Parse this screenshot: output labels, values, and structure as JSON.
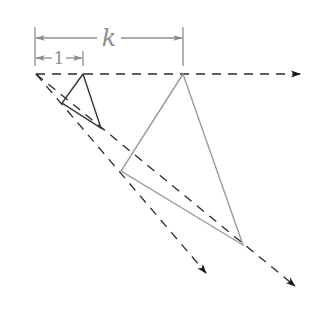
{
  "diagram": {
    "labels": {
      "k": "k",
      "one": "1"
    },
    "colors": {
      "dashed_rays": "#2a2a2a",
      "small_triangle": "#333333",
      "large_triangle": "#9a9a9a",
      "dimension_lines": "#8c8c8c"
    },
    "points": {
      "origin": [
        36,
        74
      ],
      "small_triangle": [
        [
          83,
          74
        ],
        [
          62,
          103
        ],
        [
          101,
          128
        ]
      ],
      "large_triangle": [
        [
          183,
          74
        ],
        [
          121,
          171
        ],
        [
          243,
          245
        ]
      ],
      "ray_horizontal_end": [
        300,
        74
      ],
      "ray_left_end": [
        206,
        273
      ],
      "ray_right_end": [
        295,
        286
      ]
    },
    "dimensions": [
      {
        "label": "k",
        "from_x": 35,
        "to_x": 183,
        "y": 38
      },
      {
        "label": "1",
        "from_x": 35,
        "to_x": 83,
        "y": 58
      }
    ]
  }
}
